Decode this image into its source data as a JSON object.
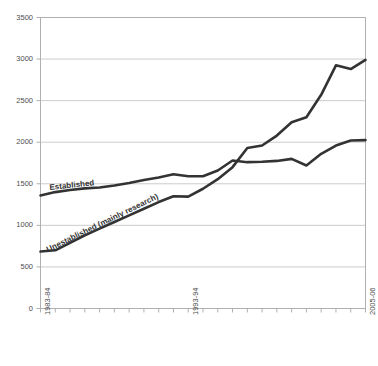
{
  "chart_data": {
    "type": "line",
    "title": "",
    "subtitle": "",
    "xlabel": "",
    "ylabel": "",
    "ylim": [
      0,
      3500
    ],
    "ytick_values": [
      0,
      500,
      1000,
      1500,
      2000,
      2500,
      3000,
      3500
    ],
    "ytick_labels": [
      "0",
      "500",
      "1000",
      "1500",
      "2000",
      "2500",
      "3000",
      "3500"
    ],
    "grid": true,
    "grid_axis": "y",
    "legend_position": "inline-annotation",
    "x": [
      "1983-84",
      "1984-85",
      "1985-86",
      "1986-87",
      "1987-88",
      "1988-89",
      "1989-90",
      "1990-91",
      "1991-92",
      "1992-93",
      "1993-94",
      "1994-95",
      "1995-96",
      "1996-97",
      "1997-98",
      "1998-99",
      "1999-00",
      "2000-01",
      "2001-02",
      "2002-03",
      "2003-04",
      "2004-05",
      "2005-06"
    ],
    "xtick_labels_shown": [
      "1983-84",
      "1993-94",
      "2005-06"
    ],
    "xtick_labels_shown_indices": [
      0,
      10,
      22
    ],
    "series": [
      {
        "name": "Established",
        "color": "#333333",
        "values": [
          1360,
          1400,
          1425,
          1445,
          1455,
          1480,
          1510,
          1545,
          1575,
          1615,
          1590,
          1590,
          1660,
          1780,
          1760,
          1765,
          1775,
          1800,
          1720,
          1860,
          1960,
          2020,
          2025
        ]
      },
      {
        "name": "Unestablished (mainly research)",
        "color": "#333333",
        "values": [
          685,
          700,
          790,
          880,
          960,
          1040,
          1120,
          1200,
          1280,
          1350,
          1345,
          1440,
          1555,
          1700,
          1930,
          1960,
          2080,
          2240,
          2300,
          2570,
          2925,
          2880,
          2990
        ]
      }
    ],
    "annotations": [
      {
        "text": "Established",
        "series": "Established"
      },
      {
        "text": "Unestablished (mainly research)",
        "series": "Unestablished (mainly research)"
      }
    ]
  },
  "style": {
    "plot_border_color": "#b0b0b0",
    "gridline_color": "#cccccc",
    "line_color": "#333333",
    "tick_text_color": "#4d4d4d",
    "background": "#ffffff"
  }
}
